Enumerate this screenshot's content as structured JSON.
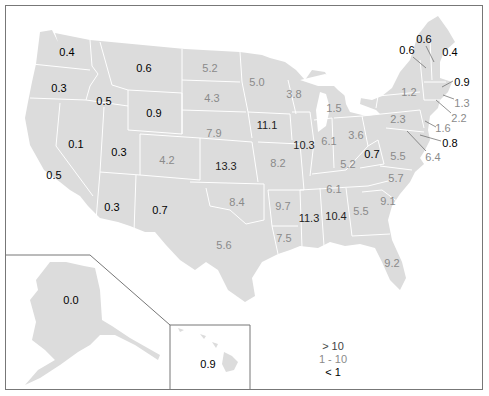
{
  "map": {
    "colors": {
      "high": "#222222",
      "mid": "#8a8a8a",
      "low": "#000000",
      "land": "#dcdcdc",
      "border": "#ffffff"
    },
    "labels": [
      {
        "state": "WA",
        "value": "0.4",
        "x": 67,
        "y": 52,
        "cls": "lo"
      },
      {
        "state": "OR",
        "value": "0.3",
        "x": 59,
        "y": 88,
        "cls": "lo"
      },
      {
        "state": "ID",
        "value": "0.5",
        "x": 104,
        "y": 101,
        "cls": "lo"
      },
      {
        "state": "MT",
        "value": "0.6",
        "x": 144,
        "y": 68,
        "cls": "lo"
      },
      {
        "state": "WY",
        "value": "0.9",
        "x": 154,
        "y": 113,
        "cls": "lo"
      },
      {
        "state": "NV",
        "value": "0.1",
        "x": 76,
        "y": 144,
        "cls": "lo"
      },
      {
        "state": "UT",
        "value": "0.3",
        "x": 119,
        "y": 152,
        "cls": "lo"
      },
      {
        "state": "CA",
        "value": "0.5",
        "x": 54,
        "y": 175,
        "cls": "lo"
      },
      {
        "state": "AZ",
        "value": "0.3",
        "x": 112,
        "y": 207,
        "cls": "lo"
      },
      {
        "state": "NM",
        "value": "0.7",
        "x": 160,
        "y": 210,
        "cls": "lo"
      },
      {
        "state": "CO",
        "value": "4.2",
        "x": 167,
        "y": 160,
        "cls": "mid"
      },
      {
        "state": "ND",
        "value": "5.2",
        "x": 210,
        "y": 68,
        "cls": "mid"
      },
      {
        "state": "SD",
        "value": "4.3",
        "x": 212,
        "y": 98,
        "cls": "mid"
      },
      {
        "state": "NE",
        "value": "7.9",
        "x": 214,
        "y": 133,
        "cls": "mid"
      },
      {
        "state": "KS",
        "value": "13.3",
        "x": 226,
        "y": 166,
        "cls": "hi"
      },
      {
        "state": "OK",
        "value": "8.4",
        "x": 237,
        "y": 202,
        "cls": "mid"
      },
      {
        "state": "TX",
        "value": "5.6",
        "x": 224,
        "y": 245,
        "cls": "mid"
      },
      {
        "state": "MN",
        "value": "5.0",
        "x": 257,
        "y": 82,
        "cls": "mid"
      },
      {
        "state": "IA",
        "value": "11.1",
        "x": 267,
        "y": 125,
        "cls": "hi"
      },
      {
        "state": "MO",
        "value": "8.2",
        "x": 278,
        "y": 163,
        "cls": "mid"
      },
      {
        "state": "AR",
        "value": "9.7",
        "x": 283,
        "y": 206,
        "cls": "mid"
      },
      {
        "state": "LA",
        "value": "7.5",
        "x": 284,
        "y": 238,
        "cls": "mid"
      },
      {
        "state": "WI",
        "value": "3.8",
        "x": 294,
        "y": 94,
        "cls": "mid"
      },
      {
        "state": "IL",
        "value": "10.3",
        "x": 304,
        "y": 145,
        "cls": "hi"
      },
      {
        "state": "MI",
        "value": "1.5",
        "x": 334,
        "y": 108,
        "cls": "mid"
      },
      {
        "state": "IN",
        "value": "6.1",
        "x": 329,
        "y": 141,
        "cls": "mid"
      },
      {
        "state": "OH",
        "value": "3.6",
        "x": 356,
        "y": 135,
        "cls": "mid"
      },
      {
        "state": "KY",
        "value": "5.2",
        "x": 348,
        "y": 164,
        "cls": "mid"
      },
      {
        "state": "TN",
        "value": "6.1",
        "x": 334,
        "y": 189,
        "cls": "mid"
      },
      {
        "state": "MS",
        "value": "11.3",
        "x": 309,
        "y": 218,
        "cls": "hi"
      },
      {
        "state": "AL",
        "value": "10.4",
        "x": 336,
        "y": 216,
        "cls": "hi"
      },
      {
        "state": "GA",
        "value": "5.5",
        "x": 361,
        "y": 211,
        "cls": "mid"
      },
      {
        "state": "FL",
        "value": "9.2",
        "x": 392,
        "y": 263,
        "cls": "mid"
      },
      {
        "state": "SC",
        "value": "9.1",
        "x": 388,
        "y": 201,
        "cls": "mid"
      },
      {
        "state": "NC",
        "value": "5.7",
        "x": 396,
        "y": 178,
        "cls": "mid"
      },
      {
        "state": "WV",
        "value": "0.7",
        "x": 372,
        "y": 154,
        "cls": "lo"
      },
      {
        "state": "VA",
        "value": "5.5",
        "x": 398,
        "y": 156,
        "cls": "mid"
      },
      {
        "state": "PA",
        "value": "2.3",
        "x": 398,
        "y": 119,
        "cls": "mid"
      },
      {
        "state": "NY",
        "value": "1.2",
        "x": 409,
        "y": 92,
        "cls": "mid"
      },
      {
        "state": "VT",
        "value": "0.6",
        "x": 407,
        "y": 50,
        "cls": "lo"
      },
      {
        "state": "NH",
        "value": "0.6",
        "x": 424,
        "y": 39,
        "cls": "lo"
      },
      {
        "state": "ME",
        "value": "0.4",
        "x": 450,
        "y": 52,
        "cls": "lo"
      },
      {
        "state": "MA",
        "value": "0.9",
        "x": 462,
        "y": 82,
        "cls": "lo"
      },
      {
        "state": "RI",
        "value": "1.3",
        "x": 462,
        "y": 103,
        "cls": "mid"
      },
      {
        "state": "CT",
        "value": "2.2",
        "x": 459,
        "y": 118,
        "cls": "mid"
      },
      {
        "state": "NJ",
        "value": "1.6",
        "x": 443,
        "y": 128,
        "cls": "mid"
      },
      {
        "state": "DE",
        "value": "0.8",
        "x": 450,
        "y": 143,
        "cls": "lo"
      },
      {
        "state": "MD",
        "value": "6.4",
        "x": 433,
        "y": 157,
        "cls": "mid"
      },
      {
        "state": "AK",
        "value": "0.0",
        "x": 71,
        "y": 300,
        "cls": "lo"
      },
      {
        "state": "HI",
        "value": "0.9",
        "x": 208,
        "y": 364,
        "cls": "lo"
      }
    ],
    "leaders": [
      {
        "x1": 426,
        "y1": 46,
        "x2": 434,
        "y2": 62
      },
      {
        "x1": 413,
        "y1": 57,
        "x2": 426,
        "y2": 68
      },
      {
        "x1": 453,
        "y1": 81,
        "x2": 442,
        "y2": 87
      },
      {
        "x1": 454,
        "y1": 99,
        "x2": 443,
        "y2": 95
      },
      {
        "x1": 451,
        "y1": 113,
        "x2": 436,
        "y2": 100
      },
      {
        "x1": 436,
        "y1": 127,
        "x2": 425,
        "y2": 121
      },
      {
        "x1": 441,
        "y1": 141,
        "x2": 420,
        "y2": 135
      },
      {
        "x1": 426,
        "y1": 151,
        "x2": 407,
        "y2": 131
      }
    ]
  },
  "legend": {
    "items": [
      {
        "label": "> 10",
        "cls": "hi"
      },
      {
        "label": "1 - 10",
        "cls": "mid"
      },
      {
        "label": "< 1",
        "cls": "lo"
      }
    ]
  }
}
